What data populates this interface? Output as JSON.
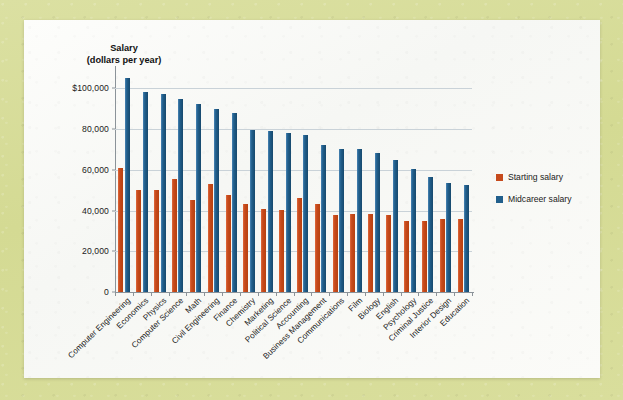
{
  "chart_data": {
    "type": "bar",
    "title": "",
    "ylabel": "Salary\n(dollars per year)",
    "ylabel_line1": "Salary",
    "ylabel_line2": "(dollars per year)",
    "xlabel": "",
    "ylim": [
      0,
      110000
    ],
    "grid": true,
    "legend_position": "right",
    "ytick_labels": [
      "$100,000",
      "80,000",
      "60,000",
      "40,000",
      "20,000",
      "0"
    ],
    "ytick_values": [
      100000,
      80000,
      60000,
      40000,
      20000,
      0
    ],
    "categories": [
      "Computer Engineering",
      "Economics",
      "Physics",
      "Computer Science",
      "Math",
      "Civil Engineering",
      "Finance",
      "Chemistry",
      "Marketing",
      "Political Science",
      "Accounting",
      "Business Management",
      "Communications",
      "Film",
      "Biology",
      "English",
      "Psychology",
      "Criminal Justice",
      "Interior Design",
      "Education"
    ],
    "series": [
      {
        "name": "Starting salary",
        "color": "#c64a1c",
        "values": [
          61000,
          50000,
          50000,
          55500,
          45000,
          53000,
          47500,
          43000,
          41000,
          40500,
          46000,
          43000,
          38000,
          38500,
          38500,
          38000,
          35000,
          35000,
          36000,
          36000
        ]
      },
      {
        "name": "Midcareer salary",
        "color": "#215f8c",
        "values": [
          105000,
          98000,
          97000,
          95000,
          92500,
          90000,
          88000,
          79500,
          79000,
          78000,
          77000,
          72000,
          70000,
          70000,
          68500,
          65000,
          60500,
          56500,
          53500,
          52500
        ]
      }
    ]
  },
  "legend": {
    "items": [
      {
        "label": "Starting salary",
        "color": "#c64a1c"
      },
      {
        "label": "Midcareer salary",
        "color": "#215f8c"
      }
    ]
  },
  "colors": {
    "page_background": "#d7dd9a",
    "card_background": "#fbfbf8",
    "starting_salary": "#c64a1c",
    "midcareer_salary": "#215f8c",
    "gridline": "#c9d2d8",
    "axis": "#8b9399"
  }
}
